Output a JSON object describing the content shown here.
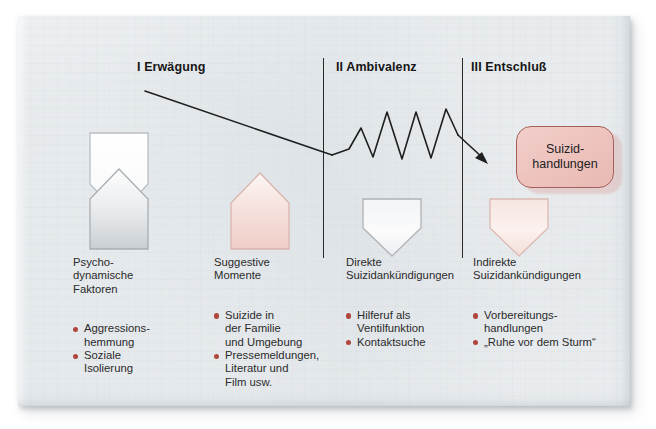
{
  "diagram": {
    "title_phases": [
      {
        "label": "I Erwägung"
      },
      {
        "label": "II Ambivalenz"
      },
      {
        "label": "III Entschluß"
      }
    ],
    "result": {
      "line1": "Suizid-",
      "line2": "handlungen"
    },
    "columns": [
      {
        "title": "Psycho-\ndynamische\nFaktoren",
        "shape": "pentagon-down-white-over-pentagon-up-gray",
        "bullets": [
          "Aggressions-\nhemmung",
          "Soziale\nIsolierung"
        ]
      },
      {
        "title": "Suggestive\nMomente",
        "shape": "pentagon-up-pink",
        "bullets": [
          "Suizide in\nder Familie\nund Umgebung",
          "Pressemeldungen,\nLiteratur und\nFilm usw."
        ]
      },
      {
        "title": "Direkte\nSuizidankündigungen",
        "shape": "pentagon-down-gray",
        "bullets": [
          "Hilferuf als\nVentilfunktion",
          "Kontaktsuche"
        ]
      },
      {
        "title": "Indirekte\nSuizidankündigungen",
        "shape": "pentagon-down-pink",
        "bullets": [
          "Vorbereitungs-\nhandlungen",
          "„Ruhe vor dem Sturm“"
        ]
      }
    ],
    "colors": {
      "bullet": "#b0453c",
      "result_fill": "#eec4bf",
      "result_border": "#a85e58",
      "line": "#1f1f1f",
      "paper": "#f0f3f4"
    }
  }
}
